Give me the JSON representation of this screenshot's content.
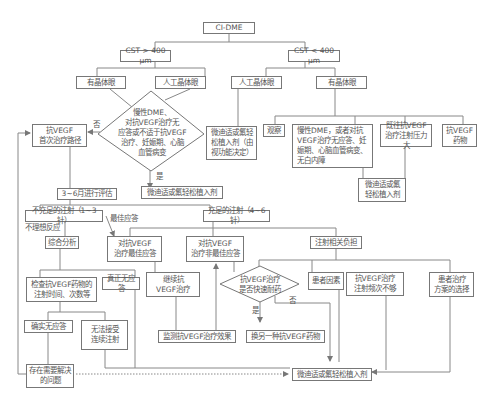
{
  "diagram": {
    "root": "CI-DME",
    "cst_high": "CST > 400 μm",
    "cst_low": "CST < 400 μm",
    "phakic_left": "有晶体眼",
    "pseudophakic_left": "人工晶体眼",
    "pseudophakic_right": "人工晶体眼",
    "phakic_right": "有晶体眼",
    "decision_main": "慢性DME、\n对抗VEGF治疗无\n应答或不适于抗VEGF\n治疗、妊娠期、心脑\n血管病变",
    "decision_main_yes": "是",
    "decision_main_no": "否",
    "anti_vegf_first": "抗VEGF\n首次治疗路径",
    "implant_after_decision": "微迪适或氟轻松植入剂",
    "implant_pseudophakic": "微迪适或氟轻\n松植入剂（由\n视功能决定）",
    "observe": "观察",
    "chronic_dme_right": "慢性DME，或者对抗\nVEGF治疗无应答、妊\n娠期、心脑血管病变、\n无白内障",
    "burden_box": "既往抗VEGF\n治疗注射压力大",
    "resistant_box": "抗VEGF\n药物",
    "implant_right": "微迪适或氟\n轻松植入剂",
    "evaluate": "3~6月进行评估",
    "insufficient": "不充足的注射（1~3针）",
    "sufficient": "充足的注射（4~6针）",
    "not_ideal_label": "不理想反应",
    "best_response_label": "最佳应答",
    "comprehensive": "综合分析",
    "best_resp_box": "对抗VEGF\n治疗最佳应答",
    "nonbest_resp_box": "对抗VEGF\n治疗非最佳应答",
    "injection_burden": "注射相关负担",
    "check_drug": "检查抗VEGF药物的\n注射时间、次数等",
    "true_nonresp": "真正无应答",
    "continue_vegf": "继续抗\nVEGF治疗",
    "decision_fast": "抗VEGF治疗\n是否快速耐药",
    "decision_fast_yes": "是",
    "decision_fast_no": "否",
    "patient_factor": "患者因素",
    "freq_insufficient": "抗VEGF治疗\n注射频次不够",
    "patient_choice": "患者治疗\n方案的选择",
    "confirmed_nonresp": "确实无应答",
    "cannot_accept": "无法接受\n连续注射",
    "monitor": "监测抗VEGF治疗效果",
    "switch_drug": "换另一种抗VEGF药物",
    "problem": "存在需要解决\n的问题",
    "final_implant": "微迪适或氟轻松植入剂"
  }
}
